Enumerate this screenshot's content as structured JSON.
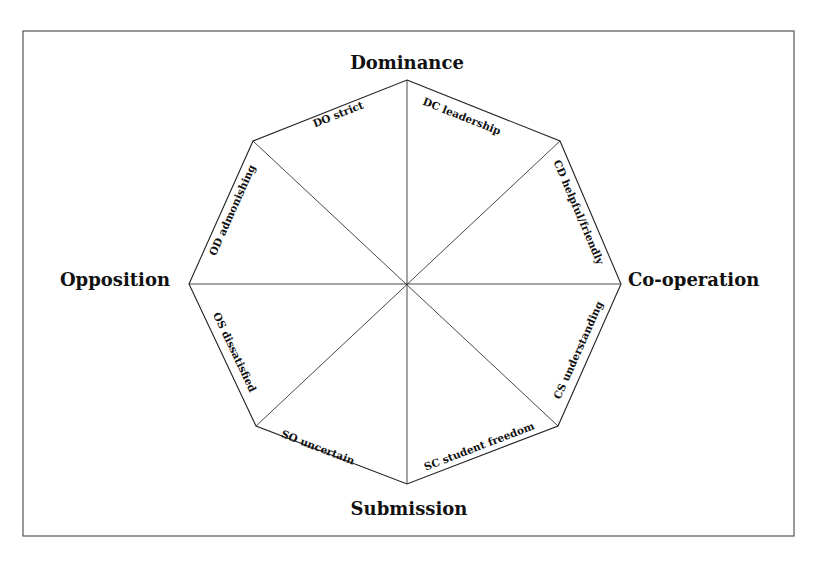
{
  "diagram": {
    "type": "octagon-model",
    "axes": {
      "top": "Dominance",
      "bottom": "Submission",
      "left": "Opposition",
      "right": "Co-operation"
    },
    "sectors": [
      {
        "code": "DC",
        "label": "DC leadership"
      },
      {
        "code": "CD",
        "label": "CD helpful/friendly"
      },
      {
        "code": "CS",
        "label": "CS understanding"
      },
      {
        "code": "SC",
        "label": "SC student freedom"
      },
      {
        "code": "SO",
        "label": "SO uncertain"
      },
      {
        "code": "OS",
        "label": "OS dissatisfied"
      },
      {
        "code": "OD",
        "label": "OD admonishing"
      },
      {
        "code": "DO",
        "label": "DO strict"
      }
    ],
    "colors": {
      "line": "#222222",
      "text": "#111111",
      "background": "#ffffff"
    }
  }
}
